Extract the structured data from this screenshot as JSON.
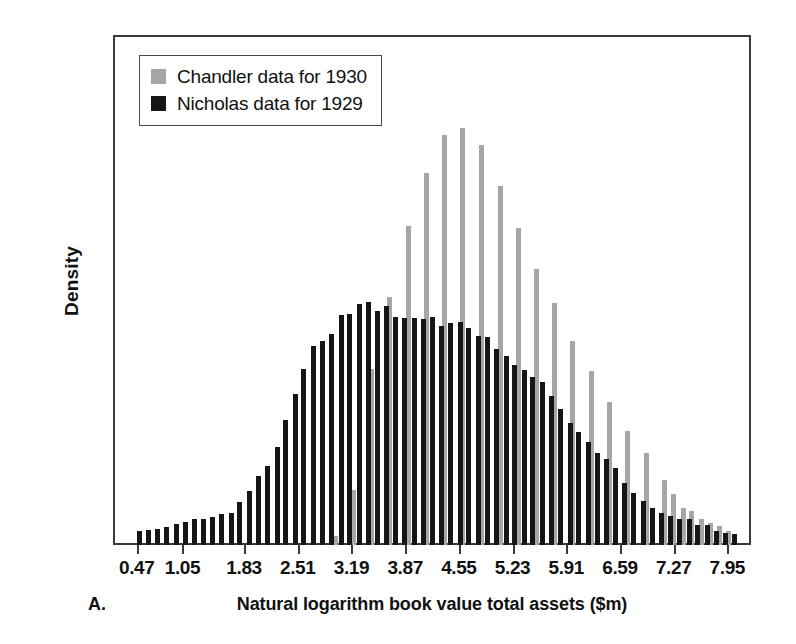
{
  "chart_data": {
    "type": "bar",
    "title": "",
    "subtitle": "",
    "panel_letter": "A.",
    "xlabel": "Natural logarithm book value total assets ($m)",
    "ylabel": "Density",
    "xlim": [
      0.17,
      8.25
    ],
    "ylim": [
      0,
      0.6
    ],
    "grid": false,
    "legend_position": "top-left",
    "ytick_labels": [
      "0",
      "0.1",
      "0.2",
      "0.3",
      "0.4",
      "0.5",
      "0.6"
    ],
    "ytick_values": [
      0,
      0.1,
      0.2,
      0.3,
      0.4,
      0.5,
      0.6
    ],
    "xtick_labels": [
      "0.47",
      "1.05",
      "1.83",
      "2.51",
      "3.19",
      "3.87",
      "4.55",
      "5.23",
      "5.91",
      "6.59",
      "7.27",
      "7.95"
    ],
    "xtick_values": [
      0.47,
      1.05,
      1.83,
      2.51,
      3.19,
      3.87,
      4.55,
      5.23,
      5.91,
      6.59,
      7.27,
      7.95
    ],
    "bin_centers": [
      0.47,
      0.58,
      0.7,
      0.81,
      0.93,
      1.05,
      1.16,
      1.28,
      1.39,
      1.51,
      1.63,
      1.74,
      1.86,
      1.97,
      2.09,
      2.21,
      2.32,
      2.44,
      2.55,
      2.67,
      2.79,
      2.9,
      3.02,
      3.13,
      3.25,
      3.37,
      3.48,
      3.6,
      3.71,
      3.83,
      3.95,
      4.06,
      4.18,
      4.29,
      4.41,
      4.53,
      4.64,
      4.76,
      4.87,
      4.99,
      5.11,
      5.22,
      5.34,
      5.45,
      5.57,
      5.69,
      5.8,
      5.92,
      6.03,
      6.15,
      6.27,
      6.38,
      6.5,
      6.61,
      6.73,
      6.85,
      6.96,
      7.08,
      7.19,
      7.31,
      7.43,
      7.54,
      7.66,
      7.77,
      7.89,
      8.0
    ],
    "series": [
      {
        "name": "Chandler data for 1930",
        "color": "#a6a6a6",
        "values": [
          0,
          0,
          0,
          0,
          0,
          0,
          0,
          0,
          0,
          0,
          0,
          0,
          0,
          0,
          0,
          0,
          0,
          0,
          0,
          0,
          0,
          0,
          0.011,
          0,
          0.065,
          0,
          0.207,
          0,
          0.292,
          0,
          0.375,
          0,
          0.438,
          0,
          0.482,
          0,
          0.49,
          0,
          0.471,
          0,
          0.422,
          0,
          0.373,
          0,
          0.325,
          0,
          0.285,
          0,
          0.24,
          0,
          0.205,
          0,
          0.168,
          0,
          0.134,
          0,
          0.108,
          0,
          0.077,
          0.06,
          0.043,
          0.04,
          0.03,
          0.026,
          0.022,
          0.016
        ]
      },
      {
        "name": "Nicholas data for 1929",
        "color": "#161616",
        "values": [
          0.017,
          0.018,
          0.019,
          0.021,
          0.025,
          0.027,
          0.03,
          0.031,
          0.033,
          0.036,
          0.038,
          0.051,
          0.064,
          0.081,
          0.093,
          0.115,
          0.147,
          0.178,
          0.207,
          0.234,
          0.24,
          0.248,
          0.27,
          0.272,
          0.283,
          0.286,
          0.275,
          0.281,
          0.268,
          0.267,
          0.267,
          0.266,
          0.268,
          0.258,
          0.261,
          0.262,
          0.255,
          0.246,
          0.245,
          0.231,
          0.222,
          0.212,
          0.206,
          0.198,
          0.192,
          0.175,
          0.16,
          0.143,
          0.133,
          0.121,
          0.108,
          0.101,
          0.09,
          0.073,
          0.061,
          0.052,
          0.043,
          0.038,
          0.034,
          0.031,
          0.03,
          0.024,
          0.023,
          0.017,
          0.014,
          0.013
        ]
      }
    ]
  },
  "legend": {
    "items": [
      {
        "label": "Chandler data for 1930",
        "color": "#a6a6a6"
      },
      {
        "label": "Nicholas data for 1929",
        "color": "#161616"
      }
    ]
  },
  "axes": {
    "y_title": "Density",
    "x_title": "Natural logarithm book value total assets ($m)",
    "panel_letter": "A."
  }
}
